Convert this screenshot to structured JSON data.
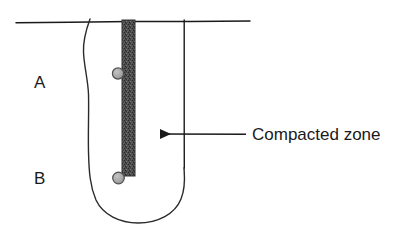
{
  "figure": {
    "background_color": "#ffffff",
    "ink_color": "#1a1a1a",
    "labels": {
      "zone_a": "A",
      "zone_b": "B",
      "callout": "Compacted zone"
    },
    "elements": {
      "ground_line_name": "ground-surface-line",
      "pile_name": "compacted-zone-band",
      "bulb_name": "influence-zone-outline",
      "pile_shaft_name": "pile-shaft-line",
      "marker_upper_name": "soil-particle-marker-upper",
      "marker_lower_name": "soil-particle-marker-lower",
      "arrow_name": "callout-arrow"
    },
    "colors": {
      "compacted_zone_fill": "#4a4a4a",
      "compacted_zone_stroke": "#2a2a2a",
      "marker_fill": "#a8a8a8",
      "marker_stroke": "#4f4f4f",
      "line": "#1a1a1a"
    },
    "geometry": {
      "ground_line_y": 22,
      "ground_line_x1": 16,
      "ground_line_x2": 250,
      "band_x": 122,
      "band_width": 13,
      "band_top": 20,
      "band_bottom": 176,
      "shaft_x": 184,
      "bulb_bottom_y": 222,
      "arrow_y": 134,
      "arrow_tip_x": 152,
      "arrow_tail_x": 246,
      "callout_text_x": 252,
      "callout_text_y": 140,
      "zone_a_x": 34,
      "zone_a_y": 88,
      "zone_b_x": 34,
      "zone_b_y": 184
    }
  }
}
